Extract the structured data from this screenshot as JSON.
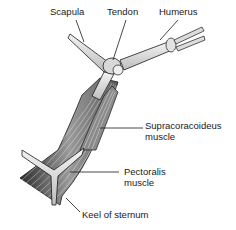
{
  "diagram": {
    "labels": {
      "scapula": "Scapula",
      "tendon": "Tendon",
      "humerus": "Humerus",
      "supracoracoideus_line1": "Supracoracoideus",
      "supracoracoideus_line2": "muscle",
      "pectoralis_line1": "Pectoralis",
      "pectoralis_line2": "muscle",
      "keel": "Keel of sternum"
    },
    "colors": {
      "ink": "#1a1a1a",
      "bone": "#e6e6e6",
      "muscle_dark": "#3a3a3a",
      "muscle_light": "#bdbdbd"
    }
  }
}
